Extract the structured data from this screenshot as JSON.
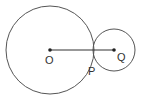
{
  "diagram": {
    "stroke_color": "#555555",
    "points": {
      "O": {
        "label": "O",
        "x": 50,
        "y": 50
      },
      "Q": {
        "label": "Q",
        "x": 114,
        "y": 50
      },
      "P": {
        "label": "P",
        "x": 93,
        "y": 50
      }
    },
    "circles": [
      {
        "name": "circle-O",
        "center": "O",
        "r": 44
      },
      {
        "name": "circle-Q",
        "center": "Q",
        "r": 21
      }
    ],
    "segments": [
      {
        "from": "O",
        "to": "Q"
      }
    ],
    "labels": {
      "O": "O",
      "P": "P",
      "Q": "Q"
    }
  }
}
